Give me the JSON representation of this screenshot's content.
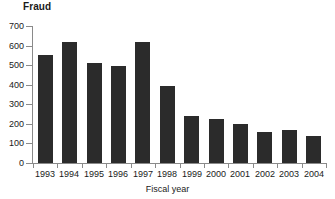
{
  "chart_data": {
    "type": "bar",
    "title": "Fraud",
    "xlabel": "Fiscal year",
    "ylabel": "",
    "categories": [
      "1993",
      "1994",
      "1995",
      "1996",
      "1997",
      "1998",
      "1999",
      "2000",
      "2001",
      "2002",
      "2003",
      "2004"
    ],
    "values": [
      553,
      620,
      512,
      495,
      617,
      394,
      240,
      225,
      199,
      158,
      168,
      138
    ],
    "series": [
      {
        "name": "Fraud",
        "values": [
          553,
          620,
          512,
          495,
          617,
          394,
          240,
          225,
          199,
          158,
          168,
          138
        ]
      }
    ],
    "ylim": [
      0,
      700
    ],
    "yticks": [
      0,
      100,
      200,
      300,
      400,
      500,
      600,
      700
    ],
    "ytick_labels": [
      "0",
      "100",
      "200",
      "300",
      "400",
      "500",
      "600",
      "700"
    ],
    "grid": false,
    "legend": false,
    "legend_position": "none",
    "bar_color": "#2b2b2b",
    "axis_color": "#8a8a8a",
    "text_color": "#1a1a1a",
    "background_color": "#ffffff"
  }
}
